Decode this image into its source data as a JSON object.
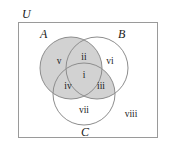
{
  "figure": {
    "type": "venn-diagram-3-set",
    "width": 170,
    "height": 148,
    "background_color": "#ffffff"
  },
  "universe": {
    "label": "U",
    "border_color": "#9a9a9a",
    "fill_color": "#ffffff"
  },
  "sets": [
    {
      "id": "A",
      "label": "A",
      "cx": 71,
      "cy": 68,
      "r": 31
    },
    {
      "id": "B",
      "label": "B",
      "cx": 97,
      "cy": 68,
      "r": 31
    },
    {
      "id": "C",
      "label": "C",
      "cx": 84,
      "cy": 94,
      "r": 31
    }
  ],
  "colors": {
    "shaded": "#d2d2d2",
    "unshaded": "#ffffff",
    "circle_stroke": "#8d8d8d",
    "text": "#1a1a1a"
  },
  "regions": [
    {
      "id": "i",
      "label": "i",
      "description": "A and B and C",
      "shaded": true,
      "x": 84,
      "y": 75
    },
    {
      "id": "ii",
      "label": "ii",
      "description": "A and B not C",
      "shaded": true,
      "x": 84,
      "y": 57
    },
    {
      "id": "iii",
      "label": "iii",
      "description": "B and C not A",
      "shaded": true,
      "x": 100,
      "y": 86
    },
    {
      "id": "iv",
      "label": "iv",
      "description": "A and C not B",
      "shaded": true,
      "x": 68,
      "y": 86
    },
    {
      "id": "v",
      "label": "v",
      "description": "A only",
      "shaded": true,
      "x": 59,
      "y": 61
    },
    {
      "id": "vi",
      "label": "vi",
      "description": "B only",
      "shaded": false,
      "x": 110,
      "y": 61
    },
    {
      "id": "vii",
      "label": "vii",
      "description": "C only",
      "shaded": false,
      "x": 84,
      "y": 110
    },
    {
      "id": "viii",
      "label": "viii",
      "description": "outside all sets",
      "shaded": false,
      "x": 131,
      "y": 114
    }
  ],
  "set_label_positions": [
    {
      "id": "A",
      "x": 40,
      "y": 38
    },
    {
      "id": "B",
      "x": 118,
      "y": 38
    },
    {
      "id": "C",
      "x": 81,
      "y": 136
    }
  ],
  "universe_label_position": {
    "x": 22,
    "y": 18
  }
}
